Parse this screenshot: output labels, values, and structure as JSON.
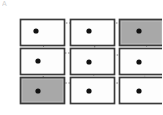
{
  "figure": {
    "corner_mark": "A",
    "background_color": "#ffffff",
    "node_stroke_color": "#3a3a3a",
    "node_fill_plain": "#fdfdfd",
    "node_fill_highlight": "#a8a8a8",
    "dot_color": "#111111",
    "link_color": "#8c8c8c",
    "link_style": "dotted"
  },
  "chart_data": {
    "type": "diagram",
    "title": "",
    "xlabel": "",
    "ylabel": "",
    "layout": "3x3 grid of rectangular nodes with center dots joined by dotted curved links",
    "grid": {
      "rows": 3,
      "cols": 3
    },
    "node_geometry": {
      "width": 44,
      "height": 26,
      "col_x": [
        20,
        70,
        119
      ],
      "row_y": [
        19,
        48,
        77
      ],
      "dot_radius": 2.6
    },
    "nodes": [
      {
        "id": "r1c1",
        "row": 1,
        "col": 1,
        "x": 20,
        "y": 19,
        "highlight": false,
        "dot_x": 36,
        "dot_y": 31
      },
      {
        "id": "r1c2",
        "row": 1,
        "col": 2,
        "x": 70,
        "y": 19,
        "highlight": false,
        "dot_x": 89,
        "dot_y": 31
      },
      {
        "id": "r1c3",
        "row": 1,
        "col": 3,
        "x": 119,
        "y": 19,
        "highlight": true,
        "dot_x": 139,
        "dot_y": 31
      },
      {
        "id": "r2c1",
        "row": 2,
        "col": 1,
        "x": 20,
        "y": 48,
        "highlight": false,
        "dot_x": 38,
        "dot_y": 61
      },
      {
        "id": "r2c2",
        "row": 2,
        "col": 2,
        "x": 70,
        "y": 48,
        "highlight": false,
        "dot_x": 89,
        "dot_y": 62
      },
      {
        "id": "r2c3",
        "row": 2,
        "col": 3,
        "x": 119,
        "y": 48,
        "highlight": false,
        "dot_x": 139,
        "dot_y": 62
      },
      {
        "id": "r3c1",
        "row": 3,
        "col": 1,
        "x": 20,
        "y": 77,
        "highlight": true,
        "dot_x": 38,
        "dot_y": 91
      },
      {
        "id": "r3c2",
        "row": 3,
        "col": 2,
        "x": 70,
        "y": 77,
        "highlight": false,
        "dot_x": 89,
        "dot_y": 91
      },
      {
        "id": "r3c3",
        "row": 3,
        "col": 3,
        "x": 119,
        "y": 77,
        "highlight": false,
        "dot_x": 139,
        "dot_y": 91
      }
    ],
    "links": [
      {
        "id": "l-r1c1-r1c2",
        "from": "r1c1",
        "to": "r1c2",
        "path": "M 36 31 C 44 22 56 23 64 23 L 95 23"
      },
      {
        "id": "l-r1c2-r1c3",
        "from": "r1c2",
        "to": "r1c3",
        "path": "M 89 31 C 96 24 106 23 114 23 L 139 23 L 139 31"
      },
      {
        "id": "l-r1c1-r2c1",
        "from": "r1c1",
        "to": "r2c1",
        "path": "M 36 31 C 40 40 44 44 44 50 C 44 56 38 56 38 61"
      },
      {
        "id": "l-r1c3-r2c3",
        "from": "r1c3",
        "to": "r2c3",
        "path": "M 139 31 C 145 40 148 44 146 50 C 144 57 139 57 139 62"
      },
      {
        "id": "l-r1c2-r2c2",
        "from": "r1c2",
        "to": "r2c2",
        "path": "M 89 31 C 94 40 96 45 94 51 C 92 58 89 57 89 62"
      },
      {
        "id": "l-r2c1-r2c2",
        "from": "r2c1",
        "to": "r2c2",
        "path": "M 38 61 C 44 54 55 53 64 53 L 114 53"
      },
      {
        "id": "l-r2c2-r2c3",
        "from": "r2c2",
        "to": "r2c3",
        "path": "M 89 62 C 98 56 110 55 119 55 L 139 55 L 139 62"
      },
      {
        "id": "l-r2c1-r3c1",
        "from": "r2c1",
        "to": "r3c1",
        "path": "M 38 61 C 42 70 44 74 43 80 C 42 87 38 86 38 91"
      },
      {
        "id": "l-r2c2-r3c2",
        "from": "r2c2",
        "to": "r3c2",
        "path": "M 89 62 C 93 70 95 75 93 81 C 91 87 89 86 89 91"
      },
      {
        "id": "l-r2c3-r3c3",
        "from": "r2c3",
        "to": "r3c3",
        "path": "M 139 62 C 144 70 146 75 144 81 C 142 87 139 86 139 91"
      },
      {
        "id": "l-r3c1-r3c2",
        "from": "r3c1",
        "to": "r3c2",
        "path": "M 38 91 C 48 84 58 83 68 83 L 95 83"
      },
      {
        "id": "l-r3c2-r3c3",
        "from": "r3c2",
        "to": "r3c3",
        "path": "M 89 91 C 98 84 110 83 119 83 L 144 83"
      }
    ]
  }
}
